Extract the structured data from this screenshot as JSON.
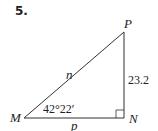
{
  "problem_number": "5.",
  "triangle": {
    "vertices": {
      "M": "M",
      "N": "N",
      "P": "P"
    },
    "sides": {
      "hypotenuse": "n",
      "base": "p",
      "vertical": "23.2"
    },
    "angle_M": "42°22′",
    "right_angle_at": "N",
    "colors": {
      "stroke": "#333333",
      "text": "#222222"
    }
  }
}
